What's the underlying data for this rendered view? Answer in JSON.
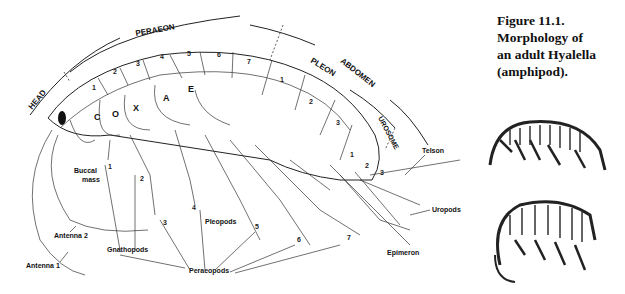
{
  "caption": {
    "line1": "Figure 11.1.  Morphology of",
    "line2": "an adult Hyalella (amphipod)."
  },
  "regions": {
    "head": "HEAD",
    "peraeon": "PERAEON",
    "pleon": "PLEON",
    "abdomen": "ABDOMEN",
    "urosome": "UROSOME",
    "coxae": [
      "C",
      "O",
      "X",
      "A",
      "E"
    ]
  },
  "segment_numbers": {
    "peraeon": [
      "1",
      "2",
      "3",
      "4",
      "5",
      "6",
      "7"
    ],
    "pleon": [
      "1",
      "2",
      "3"
    ],
    "urosome": [
      "1",
      "2",
      "3"
    ]
  },
  "labels": {
    "buccal_mass_1": "Buccal",
    "buccal_mass_2": "mass",
    "antenna_2": "Antenna 2",
    "antenna_1": "Antenna 1",
    "gnathopods": "Gnathopods",
    "peraeopods": "Peraeopods",
    "pleopods": "Pleopods",
    "telson": "Telson",
    "uropods": "Uropods",
    "epimeron": "Epimeron"
  },
  "leg_numbers": [
    "1",
    "2",
    "3",
    "4",
    "5",
    "6",
    "7"
  ],
  "thumbnails": [
    {
      "name": "hyalella-side-view"
    },
    {
      "name": "hyalella-curled-view"
    }
  ]
}
